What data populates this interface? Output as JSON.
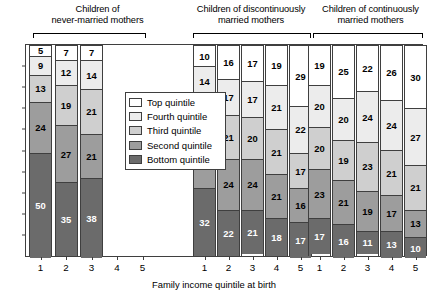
{
  "chart_data": {
    "type": "bar",
    "subtype": "stacked-column",
    "title": "",
    "xlabel": "Family income quintile at birth",
    "ylabel": "",
    "ylim": [
      0,
      100
    ],
    "yticks": [
      10,
      20,
      30,
      40,
      50,
      60,
      70,
      80,
      90
    ],
    "grid": false,
    "stack_total": 100,
    "legend_position": "inside-upper-left",
    "legend": [
      {
        "key": "q5",
        "label": "Top quintile",
        "color": "#ffffff"
      },
      {
        "key": "q4",
        "label": "Fourth quintile",
        "color": "#ececec"
      },
      {
        "key": "q3",
        "label": "Third quintile",
        "color": "#cfcfcf"
      },
      {
        "key": "q2",
        "label": "Second quintile",
        "color": "#9d9d9d"
      },
      {
        "key": "q1",
        "label": "Bottom quintile",
        "color": "#6b6b6b"
      }
    ],
    "series": [
      {
        "name": "Bottom quintile",
        "key": "q1"
      },
      {
        "name": "Second quintile",
        "key": "q2"
      },
      {
        "name": "Third quintile",
        "key": "q3"
      },
      {
        "name": "Fourth quintile",
        "key": "q4"
      },
      {
        "name": "Top quintile",
        "key": "q5"
      }
    ],
    "groups": [
      {
        "title_line1": "Children of",
        "title_line2": "never-married mothers",
        "categories": [
          "1",
          "2",
          "3",
          "4",
          "5"
        ],
        "bars": [
          {
            "category": "1",
            "q1": 50,
            "q2": 24,
            "q3": 13,
            "q4": 9,
            "q5": 5
          },
          {
            "category": "2",
            "q1": 35,
            "q2": 27,
            "q3": 19,
            "q4": 12,
            "q5": 7
          },
          {
            "category": "3",
            "q1": 38,
            "q2": 21,
            "q3": 21,
            "q4": 14,
            "q5": 7
          },
          {
            "category": "4",
            "empty": true
          },
          {
            "category": "5",
            "empty": true
          }
        ]
      },
      {
        "title_line1": "Children of discontinuously",
        "title_line2": "married mothers",
        "categories": [
          "1",
          "2",
          "3",
          "4",
          "5"
        ],
        "bars": [
          {
            "category": "1",
            "q1": 32,
            "q2": 24,
            "q3": 20,
            "q4": 14,
            "q5": 10
          },
          {
            "category": "2",
            "q1": 22,
            "q2": 24,
            "q3": 21,
            "q4": 17,
            "q5": 16
          },
          {
            "category": "3",
            "q1": 21,
            "q2": 24,
            "q3": 20,
            "q4": 17,
            "q5": 17
          },
          {
            "category": "4",
            "q1": 18,
            "q2": 21,
            "q3": 21,
            "q4": 21,
            "q5": 19
          },
          {
            "category": "5",
            "q1": 17,
            "q2": 16,
            "q3": 17,
            "q4": 22,
            "q5": 29
          }
        ]
      },
      {
        "title_line1": "Children of continuously",
        "title_line2": "married mothers",
        "categories": [
          "1",
          "2",
          "3",
          "4",
          "5"
        ],
        "bars": [
          {
            "category": "1",
            "q1": 17,
            "q2": 23,
            "q3": 20,
            "q4": 20,
            "q5": 19
          },
          {
            "category": "2",
            "q1": 16,
            "q2": 21,
            "q3": 19,
            "q4": 20,
            "q5": 25
          },
          {
            "category": "3",
            "q1": 11,
            "q2": 19,
            "q3": 23,
            "q4": 24,
            "q5": 22
          },
          {
            "category": "4",
            "q1": 13,
            "q2": 17,
            "q3": 21,
            "q4": 24,
            "q5": 26
          },
          {
            "category": "5",
            "q1": 10,
            "q2": 13,
            "q3": 21,
            "q4": 27,
            "q5": 30
          }
        ]
      }
    ]
  }
}
